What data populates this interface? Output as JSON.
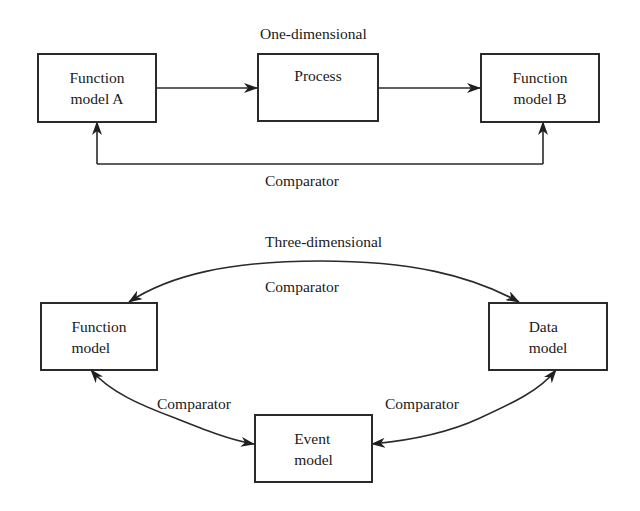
{
  "one_dimensional": {
    "title": "One-dimensional",
    "boxes": {
      "function_model_a": "Function\nmodel A",
      "process": "Process",
      "function_model_b": "Function\nmodel B"
    },
    "comparator_label": "Comparator",
    "edges": [
      {
        "from": "function_model_a",
        "to": "process",
        "label": ""
      },
      {
        "from": "process",
        "to": "function_model_b",
        "label": ""
      },
      {
        "from": "comparator_line",
        "to": "function_model_a",
        "label": "Comparator"
      },
      {
        "from": "comparator_line",
        "to": "function_model_b",
        "label": "Comparator"
      }
    ]
  },
  "three_dimensional": {
    "title": "Three-dimensional",
    "boxes": {
      "function_model": "Function\nmodel",
      "data_model": "Data\nmodel",
      "event_model": "Event\nmodel"
    },
    "comparator_top": "Comparator",
    "comparator_left": "Comparator",
    "comparator_right": "Comparator",
    "edges": [
      {
        "from": "function_model",
        "to": "data_model",
        "bidirectional": true,
        "label": "Comparator"
      },
      {
        "from": "function_model",
        "to": "event_model",
        "bidirectional": true,
        "label": "Comparator"
      },
      {
        "from": "event_model",
        "to": "data_model",
        "bidirectional": true,
        "label": "Comparator"
      }
    ]
  },
  "colors": {
    "line": "#2a2a2a",
    "background": "#ffffff",
    "text": "#1a1a1a"
  }
}
